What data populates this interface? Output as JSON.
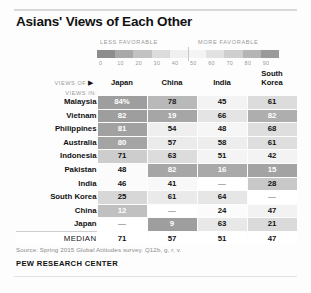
{
  "title": "Asians' Views of Each Other",
  "legend": {
    "less_label": "LESS FAVORABLE",
    "more_label": "MORE FAVORABLE",
    "ticks": [
      "0",
      "10",
      "20",
      "30",
      "40",
      "50",
      "60",
      "70",
      "80",
      "90"
    ],
    "swatches": [
      "#8c8c8c",
      "#a8a8a8",
      "#c2c2c2",
      "#dcdcdc",
      "#f0f0f0",
      "#f4f4f4",
      "#e2e2e2",
      "#cfcfcf",
      "#b5b5b5",
      "#9a9a9a"
    ]
  },
  "table": {
    "corner_label": "VIEWS OF",
    "corner_arrow": "▶",
    "rows_label": "VIEWS IN:",
    "columns": [
      "Japan",
      "China",
      "India",
      "South\nKorea"
    ],
    "column_names": [
      "Japan",
      "China",
      "India",
      "South Korea"
    ],
    "median_label": "MEDIAN"
  },
  "footer": {
    "source": "Source: Spring 2015 Global Attitudes survey. Q12b, g, r, v.",
    "brand": "PEW RESEARCH CENTER"
  },
  "chart_data": {
    "type": "heatmap",
    "title": "Asians' Views of Each Other",
    "xlabel": "VIEWS OF",
    "ylabel": "VIEWS IN:",
    "legend_position": "top",
    "grid": false,
    "value_range": [
      0,
      90
    ],
    "note": "Percent with favorable view; dash = country not asked about itself",
    "columns": [
      "Japan",
      "China",
      "India",
      "South Korea"
    ],
    "rows": [
      {
        "country": "Malaysia",
        "values": [
          "84%",
          "78",
          "45",
          "61"
        ]
      },
      {
        "country": "Vietnam",
        "values": [
          "82",
          "19",
          "66",
          "82"
        ]
      },
      {
        "country": "Philippines",
        "values": [
          "81",
          "54",
          "48",
          "68"
        ]
      },
      {
        "country": "Australia",
        "values": [
          "80",
          "57",
          "58",
          "61"
        ]
      },
      {
        "country": "Indonesia",
        "values": [
          "71",
          "63",
          "51",
          "42"
        ]
      },
      {
        "country": "Pakistan",
        "values": [
          "48",
          "82",
          "16",
          "15"
        ]
      },
      {
        "country": "India",
        "values": [
          "46",
          "41",
          "—",
          "28"
        ]
      },
      {
        "country": "South Korea",
        "values": [
          "25",
          "61",
          "64",
          "—"
        ]
      },
      {
        "country": "China",
        "values": [
          "12",
          "—",
          "24",
          "47"
        ]
      },
      {
        "country": "Japan",
        "values": [
          "—",
          "9",
          "63",
          "21"
        ]
      }
    ],
    "median": [
      "71",
      "57",
      "51",
      "47"
    ]
  },
  "cell_styles": {
    "rows": [
      [
        {
          "bg": "#9e9e9e",
          "fg": "#ffffff"
        },
        {
          "bg": "#b9b9b9",
          "fg": "#222222"
        },
        {
          "bg": "#f3f3f3",
          "fg": "#111111"
        },
        {
          "bg": "#dcdcdc",
          "fg": "#111111"
        }
      ],
      [
        {
          "bg": "#9e9e9e",
          "fg": "#ffffff"
        },
        {
          "bg": "#a6a6a6",
          "fg": "#ffffff"
        },
        {
          "bg": "#e4e4e4",
          "fg": "#111111"
        },
        {
          "bg": "#aeaeae",
          "fg": "#ffffff"
        }
      ],
      [
        {
          "bg": "#a1a1a1",
          "fg": "#ffffff"
        },
        {
          "bg": "#efefef",
          "fg": "#111111"
        },
        {
          "bg": "#f6f6f6",
          "fg": "#111111"
        },
        {
          "bg": "#dedede",
          "fg": "#111111"
        }
      ],
      [
        {
          "bg": "#a4a4a4",
          "fg": "#ffffff"
        },
        {
          "bg": "#ebebeb",
          "fg": "#111111"
        },
        {
          "bg": "#ededed",
          "fg": "#111111"
        },
        {
          "bg": "#dedede",
          "fg": "#111111"
        }
      ],
      [
        {
          "bg": "#cdcdcd",
          "fg": "#111111"
        },
        {
          "bg": "#dcdcdc",
          "fg": "#111111"
        },
        {
          "bg": "#f4f4f4",
          "fg": "#111111"
        },
        {
          "bg": "#f3f3f3",
          "fg": "#111111"
        }
      ],
      [
        {
          "bg": "#fbfbfb",
          "fg": "#111111"
        },
        {
          "bg": "#a6a6a6",
          "fg": "#ffffff"
        },
        {
          "bg": "#a9a9a9",
          "fg": "#ffffff"
        },
        {
          "bg": "#a3a3a3",
          "fg": "#ffffff"
        }
      ],
      [
        {
          "bg": "#fbfbfb",
          "fg": "#111111"
        },
        {
          "bg": "#f8f8f8",
          "fg": "#111111"
        },
        {
          "bg": "#ffffff",
          "fg": "#9a9a9a"
        },
        {
          "bg": "#c8c8c8",
          "fg": "#111111"
        }
      ],
      [
        {
          "bg": "#d7d7d7",
          "fg": "#111111"
        },
        {
          "bg": "#eaeaea",
          "fg": "#111111"
        },
        {
          "bg": "#e6e6e6",
          "fg": "#111111"
        },
        {
          "bg": "#ffffff",
          "fg": "#9a9a9a"
        }
      ],
      [
        {
          "bg": "#c0c0c0",
          "fg": "#ffffff"
        },
        {
          "bg": "#ffffff",
          "fg": "#9a9a9a"
        },
        {
          "bg": "#fbfbfb",
          "fg": "#111111"
        },
        {
          "bg": "#f2f2f2",
          "fg": "#111111"
        }
      ],
      [
        {
          "bg": "#ffffff",
          "fg": "#9a9a9a"
        },
        {
          "bg": "#9e9e9e",
          "fg": "#ffffff"
        },
        {
          "bg": "#e8e8e8",
          "fg": "#111111"
        },
        {
          "bg": "#dadada",
          "fg": "#111111"
        }
      ]
    ]
  }
}
